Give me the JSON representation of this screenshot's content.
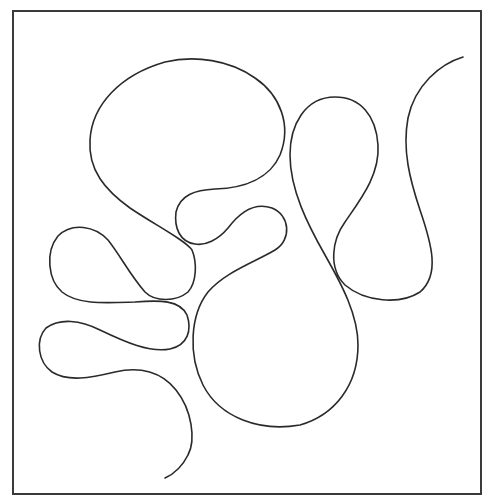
{
  "figure": {
    "type": "line-drawing",
    "frame": {
      "x": 13,
      "y": 11,
      "width": 468,
      "height": 483,
      "stroke": "#3a3a3a"
    },
    "curve": {
      "stroke": "#2a2a2a",
      "start": [
        463,
        57
      ],
      "end": [
        165,
        478
      ],
      "lobes": [
        "large top-left oval lobe",
        "small teardrop lobe (center, under top oval)",
        "large bottom-center round lobe",
        "tall teardrop lobe (center-right)",
        "right S-shaped arm ending at top right",
        "upper-left teardrop lobe",
        "lower-left teardrop lobe ending in tail"
      ]
    }
  }
}
